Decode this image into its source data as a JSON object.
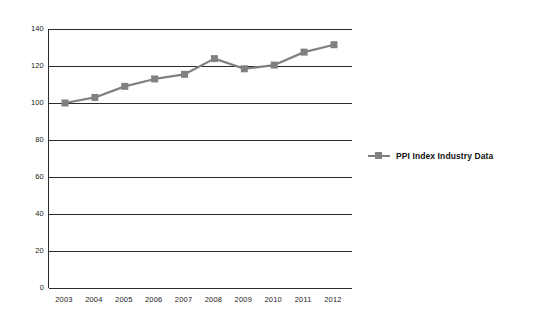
{
  "chart_data": {
    "type": "line",
    "title": "",
    "xlabel": "",
    "ylabel": "",
    "categories": [
      "2003",
      "2004",
      "2005",
      "2006",
      "2007",
      "2008",
      "2009",
      "2010",
      "2011",
      "2012"
    ],
    "series": [
      {
        "name": "PPI Index Industry Data",
        "values": [
          100,
          103,
          109,
          113,
          115.5,
          124,
          118.5,
          120.5,
          127.5,
          131.5
        ],
        "color": "#808080",
        "marker": "square"
      }
    ],
    "ylim": [
      0,
      140
    ],
    "yticks": [
      0,
      20,
      40,
      60,
      80,
      100,
      120,
      140
    ],
    "ytick_labels": [
      "0",
      "20",
      "40",
      "60",
      "80",
      "100",
      "120",
      "140"
    ],
    "grid": "horizontal",
    "legend_position": "right",
    "axis_color": "#2b2b2b",
    "background": "#ffffff"
  },
  "legend": {
    "entries": [
      {
        "label": "PPI Index Industry Data",
        "color": "#808080"
      }
    ]
  }
}
